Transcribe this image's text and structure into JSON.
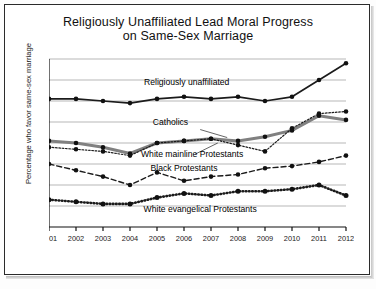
{
  "chart_data": {
    "type": "line",
    "title": "Religiously Unaffiliated Lead Moral Progress on Same-Sex Marriage",
    "title_line1": "Religiously Unaffiliated Lead Moral Progress",
    "title_line2": "on Same-Sex Marriage",
    "xlabel": "",
    "ylabel": "Percentage who favor same-sex marriage",
    "x": [
      2001,
      2002,
      2003,
      2004,
      2005,
      2006,
      2007,
      2008,
      2009,
      2010,
      2011,
      2012
    ],
    "categories": [
      "2001",
      "2002",
      "2003",
      "2004",
      "2005",
      "2006",
      "2007",
      "2008",
      "2009",
      "2010",
      "2011",
      "2012"
    ],
    "ylim": [
      0,
      80
    ],
    "yticks": [
      0,
      10,
      20,
      30,
      40,
      50,
      60,
      70,
      80
    ],
    "grid": true,
    "legend": "inline-annotations",
    "series": [
      {
        "name": "Religiously unaffiliated",
        "style": "solid-black",
        "values": [
          61,
          61,
          60,
          59,
          61,
          62,
          61,
          62,
          60,
          62,
          70,
          78
        ]
      },
      {
        "name": "Catholics",
        "style": "solid-gray-thick",
        "values": [
          41,
          40,
          38,
          35,
          40,
          41,
          42,
          41,
          43,
          46,
          53,
          51
        ]
      },
      {
        "name": "White mainline Protestants",
        "style": "fine-dotted",
        "values": [
          38,
          37,
          36,
          34,
          40,
          41,
          42,
          39,
          36,
          47,
          54,
          55
        ]
      },
      {
        "name": "Black Protestants",
        "style": "dashed",
        "values": [
          30,
          27,
          24,
          20,
          26,
          22,
          24,
          25,
          28,
          29,
          31,
          34
        ]
      },
      {
        "name": "White evangelical Protestants",
        "style": "thick-dotted",
        "values": [
          13,
          12,
          11,
          11,
          14,
          16,
          15,
          17,
          17,
          18,
          20,
          15
        ]
      }
    ],
    "annotations": [
      {
        "text": "Religiously unaffiliated"
      },
      {
        "text": "Catholics"
      },
      {
        "text": "White mainline Protestants"
      },
      {
        "text": "Black Protestants"
      },
      {
        "text": "White evangelical Protestants"
      }
    ]
  }
}
